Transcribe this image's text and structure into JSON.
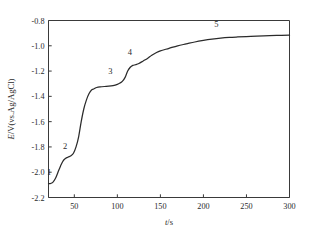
{
  "chart_data": {
    "type": "line",
    "title": "",
    "subtitle": "",
    "xlabel": "t/s",
    "ylabel": "E/V(vs.Ag/AgCl)",
    "xlim": [
      20,
      300
    ],
    "ylim": [
      -2.2,
      -0.8
    ],
    "grid": false,
    "legend": false,
    "x_ticks": [
      50,
      100,
      150,
      200,
      250,
      300
    ],
    "x_ticklabels": [
      "50",
      "100",
      "150",
      "200",
      "250",
      "300"
    ],
    "y_ticks": [
      -0.8,
      -1.0,
      -1.2,
      -1.4,
      -1.6,
      -1.8,
      -2.0,
      -2.2
    ],
    "y_ticklabels": [
      "-0.8",
      "-1.0",
      "-1.2",
      "-1.4",
      "-1.6",
      "-1.8",
      "-2.0",
      "-2.2"
    ],
    "series": [
      {
        "name": "potential-time",
        "color": "#2b2b2b",
        "x": [
          20,
          22,
          25,
          28,
          31,
          34,
          37,
          40,
          43,
          46,
          49,
          52,
          55,
          58,
          61,
          64,
          67,
          70,
          73,
          76,
          80,
          85,
          90,
          95,
          100,
          103,
          106,
          109,
          112,
          115,
          118,
          121,
          125,
          130,
          135,
          140,
          145,
          150,
          160,
          170,
          180,
          190,
          200,
          210,
          220,
          230,
          240,
          255,
          270,
          285,
          300
        ],
        "y": [
          -2.09,
          -2.09,
          -2.08,
          -2.05,
          -2.0,
          -1.95,
          -1.91,
          -1.89,
          -1.88,
          -1.87,
          -1.85,
          -1.8,
          -1.72,
          -1.6,
          -1.5,
          -1.43,
          -1.38,
          -1.35,
          -1.34,
          -1.33,
          -1.325,
          -1.322,
          -1.32,
          -1.315,
          -1.305,
          -1.295,
          -1.28,
          -1.25,
          -1.2,
          -1.17,
          -1.155,
          -1.15,
          -1.14,
          -1.12,
          -1.1,
          -1.075,
          -1.055,
          -1.04,
          -1.02,
          -1.0,
          -0.985,
          -0.97,
          -0.958,
          -0.948,
          -0.94,
          -0.934,
          -0.93,
          -0.925,
          -0.921,
          -0.918,
          -0.916
        ]
      }
    ],
    "annotations": [
      {
        "label": "1",
        "x": 23,
        "y": -2.05,
        "dx": -2,
        "dy": -4
      },
      {
        "label": "2",
        "x": 44,
        "y": -1.88,
        "dx": -4,
        "dy": -8
      },
      {
        "label": "3",
        "x": 92,
        "y": -1.32,
        "dx": 0,
        "dy": -12
      },
      {
        "label": "4",
        "x": 117,
        "y": -1.17,
        "dx": -2,
        "dy": -12
      },
      {
        "label": "5",
        "x": 215,
        "y": -0.945,
        "dx": 0,
        "dy": -12
      }
    ]
  }
}
